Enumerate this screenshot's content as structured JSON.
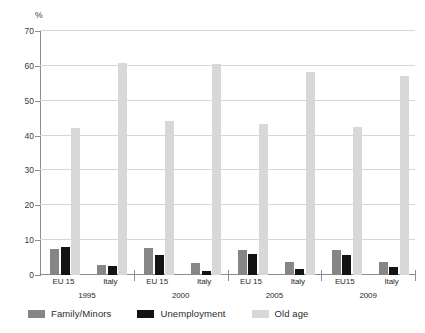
{
  "chart_data": {
    "type": "bar",
    "title": "",
    "xlabel": "",
    "ylabel": "%",
    "ylim": [
      0,
      70
    ],
    "ytick_step": 10,
    "yticks": [
      70,
      60,
      50,
      40,
      30,
      20,
      10,
      0
    ],
    "grid": true,
    "legend_position": "bottom",
    "categories": [
      "EU 15",
      "Italy",
      "EU 15",
      "Italy",
      "EU 15",
      "Italy",
      "EU15",
      "Italy"
    ],
    "group_years": [
      "1995",
      "2000",
      "2005",
      "2009"
    ],
    "series": [
      {
        "name": "Family/Minors",
        "color": "#868686",
        "values": [
          7.5,
          2.9,
          7.7,
          3.4,
          7.3,
          3.6,
          7.2,
          3.8
        ]
      },
      {
        "name": "Unemployment",
        "color": "#131313",
        "values": [
          7.9,
          2.7,
          5.7,
          1.2,
          5.9,
          1.7,
          5.6,
          2.2
        ]
      },
      {
        "name": "Old age",
        "color": "#d8d8d8",
        "values": [
          42.3,
          60.8,
          44.3,
          60.5,
          43.4,
          58.2,
          42.4,
          57.0
        ]
      }
    ]
  },
  "axis": {
    "unit_label": "%",
    "tick_labels": [
      "70",
      "60",
      "50",
      "40",
      "30",
      "20",
      "10",
      "0"
    ]
  },
  "xaxis": {
    "groups": [
      {
        "region": "EU 15",
        "year": ""
      },
      {
        "region": "Italy",
        "year": "1995"
      },
      {
        "region": "EU 15",
        "year": ""
      },
      {
        "region": "Italy",
        "year": "2000"
      },
      {
        "region": "EU 15",
        "year": ""
      },
      {
        "region": "Italy",
        "year": "2005"
      },
      {
        "region": "EU15",
        "year": ""
      },
      {
        "region": "Italy",
        "year": "2009"
      }
    ],
    "year_labels": [
      "1995",
      "2000",
      "2005",
      "2009"
    ]
  },
  "legend": {
    "items": [
      {
        "label": "Family/Minors",
        "color": "#868686"
      },
      {
        "label": "Unemployment",
        "color": "#131313"
      },
      {
        "label": "Old age",
        "color": "#d8d8d8"
      }
    ]
  }
}
